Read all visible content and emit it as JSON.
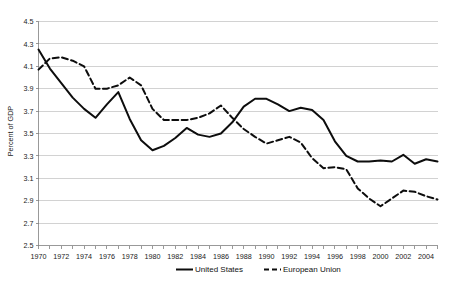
{
  "chart_data": {
    "type": "line",
    "title": "",
    "subtitle": "",
    "xlabel": "",
    "ylabel": "Percent of GDP",
    "xlim": [
      1970,
      2005
    ],
    "ylim": [
      2.5,
      4.5
    ],
    "yticks": [
      "2.5",
      "2.7",
      "2.9",
      "3.1",
      "3.3",
      "3.5",
      "3.7",
      "3.9",
      "4.1",
      "4.3",
      "4.5"
    ],
    "ytick_step": 0.2,
    "xticks": [
      "1970",
      "1972",
      "1974",
      "1976",
      "1978",
      "1980",
      "1982",
      "1984",
      "1986",
      "1988",
      "1990",
      "1992",
      "1994",
      "1996",
      "1998",
      "2000",
      "2002",
      "2004"
    ],
    "xtick_step": 2,
    "minor_x_step": 1,
    "grid": "horizontal",
    "legend_position": "bottom",
    "x": [
      1970,
      1971,
      1972,
      1973,
      1974,
      1975,
      1976,
      1977,
      1978,
      1979,
      1980,
      1981,
      1982,
      1983,
      1984,
      1985,
      1986,
      1987,
      1988,
      1989,
      1990,
      1991,
      1992,
      1993,
      1994,
      1995,
      1996,
      1997,
      1998,
      1999,
      2000,
      2001,
      2002,
      2003,
      2004,
      2005
    ],
    "series": [
      {
        "name": "United States",
        "style": "solid",
        "color": "#0d0d0d",
        "values": [
          4.25,
          4.08,
          3.95,
          3.82,
          3.72,
          3.64,
          3.76,
          3.87,
          3.63,
          3.44,
          3.35,
          3.39,
          3.46,
          3.55,
          3.49,
          3.47,
          3.5,
          3.6,
          3.74,
          3.81,
          3.81,
          3.76,
          3.7,
          3.73,
          3.71,
          3.62,
          3.43,
          3.3,
          3.25,
          3.25,
          3.26,
          3.25,
          3.31,
          3.23,
          3.27,
          3.25
        ]
      },
      {
        "name": "European Union",
        "style": "dashed",
        "color": "#0d0d0d",
        "values": [
          4.07,
          4.17,
          4.18,
          4.15,
          4.1,
          3.9,
          3.9,
          3.93,
          4.0,
          3.93,
          3.72,
          3.62,
          3.62,
          3.62,
          3.64,
          3.68,
          3.75,
          3.64,
          3.54,
          3.47,
          3.41,
          3.44,
          3.47,
          3.42,
          3.28,
          3.19,
          3.2,
          3.18,
          3.01,
          2.92,
          2.85,
          2.92,
          2.99,
          2.98,
          2.94,
          2.91
        ]
      }
    ],
    "legend": [
      {
        "label": "United States",
        "style": "solid"
      },
      {
        "label": "European Union",
        "style": "dashed"
      }
    ]
  }
}
